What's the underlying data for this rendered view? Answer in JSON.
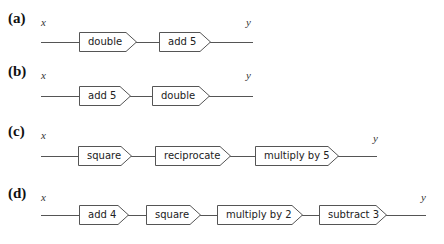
{
  "panels": [
    {
      "label": "(a)",
      "input": "x",
      "output": "y",
      "steps": [
        "double",
        "add 5"
      ]
    },
    {
      "label": "(b)",
      "input": "x",
      "output": "y",
      "steps": [
        "add 5",
        "double"
      ]
    },
    {
      "label": "(c)",
      "input": "x",
      "output": "y",
      "steps": [
        "square",
        "reciprocate",
        "multiply by 5"
      ]
    },
    {
      "label": "(d)",
      "input": "x",
      "output": "y",
      "steps": [
        "add 4",
        "square",
        "multiply by 2",
        "subtract 3"
      ]
    }
  ],
  "colors": {
    "stroke": "#555555",
    "text": "#222222"
  }
}
